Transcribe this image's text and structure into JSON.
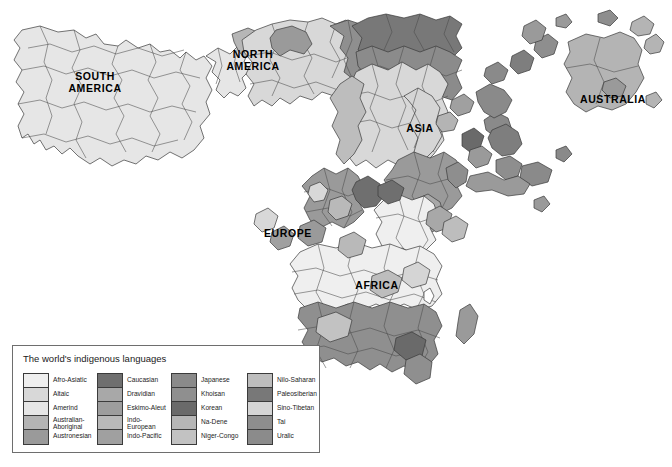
{
  "map": {
    "title": "The world's indigenous languages",
    "background_color": "#ffffff",
    "continent_labels": [
      {
        "name": "south-america",
        "text": "SOUTH\nAMERICA",
        "x": 95,
        "y": 76
      },
      {
        "name": "north-america",
        "text": "NORTH\nAMERICA",
        "x": 253,
        "y": 54
      },
      {
        "name": "asia",
        "text": "ASIA",
        "x": 420,
        "y": 127
      },
      {
        "name": "australia",
        "text": "AUSTRALIA",
        "x": 613,
        "y": 99
      },
      {
        "name": "europe",
        "text": "EUROPE",
        "x": 288,
        "y": 233
      },
      {
        "name": "africa",
        "text": "AFRICA",
        "x": 377,
        "y": 285
      }
    ]
  },
  "legend": {
    "title": "The world's indigenous languages",
    "columns": [
      {
        "index": 0,
        "entries": [
          {
            "label": "Afro-Asiatic",
            "color": "#efefef"
          },
          {
            "label": "Altaic",
            "color": "#d8d8d8"
          },
          {
            "label": "Amerind",
            "color": "#e6e6e6"
          },
          {
            "label": "Australian-\nAboriginal",
            "color": "#b4b4b4"
          },
          {
            "label": "Austronesian",
            "color": "#9a9a9a"
          }
        ]
      },
      {
        "index": 1,
        "entries": [
          {
            "label": "Caucasian",
            "color": "#6f6f6f"
          },
          {
            "label": "Dravidian",
            "color": "#a8a8a8"
          },
          {
            "label": "Eskimo-Aleut",
            "color": "#9d9d9d"
          },
          {
            "label": "Indo-\nEuropean",
            "color": "#b9b9b9"
          },
          {
            "label": "Indo-Pacific",
            "color": "#a0a0a0"
          }
        ]
      },
      {
        "index": 2,
        "entries": [
          {
            "label": "Japanese",
            "color": "#8a8a8a"
          },
          {
            "label": "Khoisan",
            "color": "#8f8f8f"
          },
          {
            "label": "Korean",
            "color": "#6a6a6a"
          },
          {
            "label": "Na-Dene",
            "color": "#b6b6b6"
          },
          {
            "label": "Niger-Congo",
            "color": "#c2c2c2"
          }
        ]
      },
      {
        "index": 3,
        "entries": [
          {
            "label": "Nilo-Saharan",
            "color": "#bdbdbd"
          },
          {
            "label": "Paleosiberian",
            "color": "#787878"
          },
          {
            "label": "Sino-Tibetan",
            "color": "#d5d5d5"
          },
          {
            "label": "Tai",
            "color": "#8e8e8e"
          },
          {
            "label": "Uralic",
            "color": "#8b8b8b"
          }
        ]
      }
    ]
  }
}
